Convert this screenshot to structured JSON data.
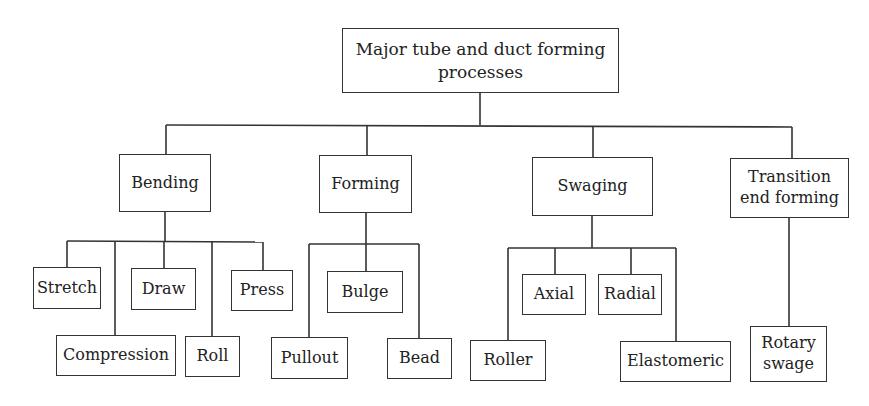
{
  "root": {
    "label": "Major tube and duct forming\nprocesses"
  },
  "categories": [
    {
      "label": "Bending",
      "children": [
        "Stretch",
        "Compression",
        "Draw",
        "Roll",
        "Press"
      ]
    },
    {
      "label": "Forming",
      "children": [
        "Pullout",
        "Bulge",
        "Bead"
      ]
    },
    {
      "label": "Swaging",
      "children": [
        "Roller",
        "Axial",
        "Radial",
        "Elastomeric"
      ]
    },
    {
      "label": "Transition\nend forming",
      "children": [
        "Rotary\nswage"
      ]
    }
  ],
  "colors": {
    "line": "#333333",
    "background": "#ffffff",
    "text": "#222222"
  }
}
